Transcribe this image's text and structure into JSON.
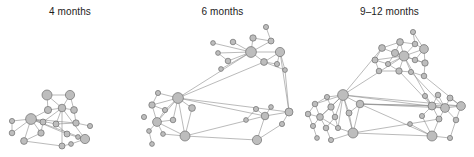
{
  "figure": {
    "background_color": "#ffffff",
    "node_fill_color": "#bdbdbd",
    "node_stroke_color": "#6e6e6e",
    "edge_color": "#8c8c8c",
    "title_color": "#1c1c1c"
  },
  "panels": [
    {
      "id": "panel-4-months",
      "title": "4 months",
      "left": 0,
      "width": 140,
      "node_count": 19,
      "edge_count": 33,
      "nodes": [
        {
          "id": 0,
          "x": 47,
          "y": 95,
          "r": 5.0
        },
        {
          "id": 1,
          "x": 70,
          "y": 95,
          "r": 4.6
        },
        {
          "id": 2,
          "x": 48,
          "y": 110,
          "r": 3.6
        },
        {
          "id": 3,
          "x": 62,
          "y": 108,
          "r": 3.8
        },
        {
          "id": 4,
          "x": 74,
          "y": 110,
          "r": 3.4
        },
        {
          "id": 5,
          "x": 31,
          "y": 119,
          "r": 5.4
        },
        {
          "id": 6,
          "x": 12,
          "y": 121,
          "r": 2.6
        },
        {
          "id": 7,
          "x": 12,
          "y": 133,
          "r": 2.8
        },
        {
          "id": 8,
          "x": 43,
          "y": 122,
          "r": 3.0
        },
        {
          "id": 9,
          "x": 56,
          "y": 124,
          "r": 3.0
        },
        {
          "id": 10,
          "x": 76,
          "y": 123,
          "r": 3.2
        },
        {
          "id": 11,
          "x": 90,
          "y": 126,
          "r": 2.6
        },
        {
          "id": 12,
          "x": 41,
          "y": 133,
          "r": 3.2
        },
        {
          "id": 13,
          "x": 24,
          "y": 141,
          "r": 3.4
        },
        {
          "id": 14,
          "x": 67,
          "y": 134,
          "r": 3.0
        },
        {
          "id": 15,
          "x": 78,
          "y": 137,
          "r": 2.4
        },
        {
          "id": 16,
          "x": 85,
          "y": 139,
          "r": 4.6
        },
        {
          "id": 17,
          "x": 62,
          "y": 146,
          "r": 3.0
        },
        {
          "id": 18,
          "x": 71,
          "y": 144,
          "r": 2.4
        }
      ],
      "edges": [
        [
          0,
          1
        ],
        [
          0,
          3
        ],
        [
          0,
          2
        ],
        [
          1,
          3
        ],
        [
          1,
          4
        ],
        [
          2,
          3
        ],
        [
          2,
          5
        ],
        [
          3,
          4
        ],
        [
          3,
          8
        ],
        [
          3,
          9
        ],
        [
          3,
          16
        ],
        [
          3,
          17
        ],
        [
          4,
          10
        ],
        [
          5,
          6
        ],
        [
          5,
          7
        ],
        [
          5,
          8
        ],
        [
          5,
          12
        ],
        [
          5,
          13
        ],
        [
          5,
          9
        ],
        [
          5,
          10
        ],
        [
          5,
          14
        ],
        [
          5,
          16
        ],
        [
          6,
          7
        ],
        [
          8,
          12
        ],
        [
          9,
          10
        ],
        [
          9,
          14
        ],
        [
          10,
          11
        ],
        [
          12,
          13
        ],
        [
          13,
          17
        ],
        [
          14,
          16
        ],
        [
          15,
          16
        ],
        [
          16,
          18
        ],
        [
          17,
          18
        ]
      ]
    },
    {
      "id": "panel-6-months",
      "title": "6 months",
      "left": 140,
      "width": 165,
      "node_count": 32,
      "edge_count": 45,
      "nodes": [
        {
          "id": 0,
          "x": 126,
          "y": 27,
          "r": 2.6
        },
        {
          "id": 1,
          "x": 113,
          "y": 38,
          "r": 3.2
        },
        {
          "id": 2,
          "x": 131,
          "y": 41,
          "r": 3.0
        },
        {
          "id": 3,
          "x": 73,
          "y": 43,
          "r": 2.4
        },
        {
          "id": 4,
          "x": 93,
          "y": 42,
          "r": 2.8
        },
        {
          "id": 5,
          "x": 111,
          "y": 52,
          "r": 5.4
        },
        {
          "id": 6,
          "x": 140,
          "y": 52,
          "r": 4.6
        },
        {
          "id": 7,
          "x": 78,
          "y": 53,
          "r": 2.4
        },
        {
          "id": 8,
          "x": 88,
          "y": 61,
          "r": 2.8
        },
        {
          "id": 9,
          "x": 124,
          "y": 62,
          "r": 3.4
        },
        {
          "id": 10,
          "x": 137,
          "y": 64,
          "r": 2.6
        },
        {
          "id": 11,
          "x": 81,
          "y": 69,
          "r": 2.4
        },
        {
          "id": 12,
          "x": 145,
          "y": 70,
          "r": 2.4
        },
        {
          "id": 13,
          "x": 38,
          "y": 98,
          "r": 5.4
        },
        {
          "id": 14,
          "x": 18,
          "y": 93,
          "r": 2.6
        },
        {
          "id": 15,
          "x": 12,
          "y": 105,
          "r": 3.2
        },
        {
          "id": 16,
          "x": 25,
          "y": 110,
          "r": 2.6
        },
        {
          "id": 17,
          "x": 52,
          "y": 108,
          "r": 3.4
        },
        {
          "id": 18,
          "x": 4,
          "y": 117,
          "r": 2.6
        },
        {
          "id": 19,
          "x": 17,
          "y": 122,
          "r": 4.4
        },
        {
          "id": 20,
          "x": 33,
          "y": 120,
          "r": 2.8
        },
        {
          "id": 21,
          "x": 9,
          "y": 131,
          "r": 2.4
        },
        {
          "id": 22,
          "x": 23,
          "y": 134,
          "r": 2.4
        },
        {
          "id": 23,
          "x": 45,
          "y": 136,
          "r": 5.0
        },
        {
          "id": 24,
          "x": 12,
          "y": 144,
          "r": 2.4
        },
        {
          "id": 25,
          "x": 106,
          "y": 120,
          "r": 2.4
        },
        {
          "id": 26,
          "x": 116,
          "y": 109,
          "r": 2.6
        },
        {
          "id": 27,
          "x": 131,
          "y": 107,
          "r": 2.4
        },
        {
          "id": 28,
          "x": 125,
          "y": 116,
          "r": 3.8
        },
        {
          "id": 29,
          "x": 149,
          "y": 112,
          "r": 4.0
        },
        {
          "id": 30,
          "x": 142,
          "y": 124,
          "r": 2.6
        },
        {
          "id": 31,
          "x": 117,
          "y": 140,
          "r": 4.6
        }
      ],
      "edges": [
        [
          0,
          2
        ],
        [
          1,
          2
        ],
        [
          1,
          5
        ],
        [
          2,
          5
        ],
        [
          3,
          5
        ],
        [
          4,
          5
        ],
        [
          5,
          6
        ],
        [
          5,
          7
        ],
        [
          5,
          8
        ],
        [
          5,
          9
        ],
        [
          5,
          11
        ],
        [
          6,
          9
        ],
        [
          6,
          10
        ],
        [
          6,
          12
        ],
        [
          7,
          8
        ],
        [
          9,
          10
        ],
        [
          9,
          12
        ],
        [
          5,
          13
        ],
        [
          9,
          13
        ],
        [
          13,
          14
        ],
        [
          13,
          15
        ],
        [
          13,
          16
        ],
        [
          13,
          17
        ],
        [
          13,
          19
        ],
        [
          13,
          20
        ],
        [
          13,
          23
        ],
        [
          13,
          29
        ],
        [
          13,
          28
        ],
        [
          14,
          15
        ],
        [
          15,
          16
        ],
        [
          15,
          19
        ],
        [
          16,
          19
        ],
        [
          17,
          23
        ],
        [
          19,
          20
        ],
        [
          19,
          21
        ],
        [
          19,
          22
        ],
        [
          19,
          23
        ],
        [
          21,
          24
        ],
        [
          22,
          23
        ],
        [
          23,
          31
        ],
        [
          25,
          26
        ],
        [
          26,
          28
        ],
        [
          27,
          28
        ],
        [
          28,
          29
        ],
        [
          28,
          31
        ],
        [
          29,
          30
        ],
        [
          6,
          29
        ],
        [
          12,
          29
        ],
        [
          30,
          31
        ],
        [
          23,
          28
        ]
      ]
    },
    {
      "id": "panel-9-12-months",
      "title": "9–12 months",
      "left": 305,
      "width": 169,
      "node_count": 42,
      "edge_count": 78,
      "nodes": [
        {
          "id": 0,
          "x": 108,
          "y": 32,
          "r": 2.6
        },
        {
          "id": 1,
          "x": 95,
          "y": 42,
          "r": 3.4
        },
        {
          "id": 2,
          "x": 110,
          "y": 44,
          "r": 2.8
        },
        {
          "id": 3,
          "x": 77,
          "y": 48,
          "r": 3.4
        },
        {
          "id": 4,
          "x": 90,
          "y": 53,
          "r": 3.6
        },
        {
          "id": 5,
          "x": 119,
          "y": 49,
          "r": 4.4
        },
        {
          "id": 6,
          "x": 99,
          "y": 56,
          "r": 5.0
        },
        {
          "id": 7,
          "x": 70,
          "y": 60,
          "r": 3.0
        },
        {
          "id": 8,
          "x": 110,
          "y": 60,
          "r": 2.8
        },
        {
          "id": 9,
          "x": 83,
          "y": 64,
          "r": 2.6
        },
        {
          "id": 10,
          "x": 120,
          "y": 63,
          "r": 3.2
        },
        {
          "id": 11,
          "x": 74,
          "y": 71,
          "r": 2.8
        },
        {
          "id": 12,
          "x": 94,
          "y": 71,
          "r": 3.2
        },
        {
          "id": 13,
          "x": 106,
          "y": 72,
          "r": 2.6
        },
        {
          "id": 14,
          "x": 119,
          "y": 76,
          "r": 2.8
        },
        {
          "id": 15,
          "x": 38,
          "y": 95,
          "r": 5.4
        },
        {
          "id": 16,
          "x": 22,
          "y": 97,
          "r": 2.6
        },
        {
          "id": 17,
          "x": 10,
          "y": 104,
          "r": 2.8
        },
        {
          "id": 18,
          "x": 26,
          "y": 107,
          "r": 3.2
        },
        {
          "id": 19,
          "x": 55,
          "y": 104,
          "r": 3.8
        },
        {
          "id": 20,
          "x": 3,
          "y": 114,
          "r": 2.8
        },
        {
          "id": 21,
          "x": 15,
          "y": 117,
          "r": 3.4
        },
        {
          "id": 22,
          "x": 30,
          "y": 117,
          "r": 2.8
        },
        {
          "id": 23,
          "x": 44,
          "y": 113,
          "r": 3.0
        },
        {
          "id": 24,
          "x": 8,
          "y": 126,
          "r": 2.6
        },
        {
          "id": 25,
          "x": 21,
          "y": 128,
          "r": 2.8
        },
        {
          "id": 26,
          "x": 33,
          "y": 128,
          "r": 2.6
        },
        {
          "id": 27,
          "x": 48,
          "y": 133,
          "r": 5.0
        },
        {
          "id": 28,
          "x": 12,
          "y": 138,
          "r": 2.4
        },
        {
          "id": 29,
          "x": 26,
          "y": 140,
          "r": 2.6
        },
        {
          "id": 30,
          "x": 105,
          "y": 124,
          "r": 2.4
        },
        {
          "id": 31,
          "x": 120,
          "y": 96,
          "r": 2.6
        },
        {
          "id": 32,
          "x": 133,
          "y": 95,
          "r": 2.8
        },
        {
          "id": 33,
          "x": 145,
          "y": 98,
          "r": 3.0
        },
        {
          "id": 34,
          "x": 127,
          "y": 106,
          "r": 4.0
        },
        {
          "id": 35,
          "x": 140,
          "y": 108,
          "r": 4.4
        },
        {
          "id": 36,
          "x": 156,
          "y": 106,
          "r": 4.4
        },
        {
          "id": 37,
          "x": 117,
          "y": 116,
          "r": 2.6
        },
        {
          "id": 38,
          "x": 134,
          "y": 119,
          "r": 3.0
        },
        {
          "id": 39,
          "x": 151,
          "y": 120,
          "r": 2.8
        },
        {
          "id": 40,
          "x": 127,
          "y": 136,
          "r": 5.0
        },
        {
          "id": 41,
          "x": 145,
          "y": 138,
          "r": 2.6
        }
      ],
      "edges": [
        [
          0,
          2
        ],
        [
          0,
          5
        ],
        [
          1,
          2
        ],
        [
          1,
          4
        ],
        [
          1,
          3
        ],
        [
          1,
          6
        ],
        [
          2,
          5
        ],
        [
          2,
          6
        ],
        [
          3,
          4
        ],
        [
          3,
          7
        ],
        [
          4,
          6
        ],
        [
          4,
          9
        ],
        [
          5,
          6
        ],
        [
          5,
          10
        ],
        [
          5,
          8
        ],
        [
          6,
          8
        ],
        [
          6,
          9
        ],
        [
          6,
          10
        ],
        [
          6,
          12
        ],
        [
          6,
          13
        ],
        [
          6,
          7
        ],
        [
          7,
          9
        ],
        [
          7,
          11
        ],
        [
          8,
          10
        ],
        [
          9,
          12
        ],
        [
          10,
          14
        ],
        [
          11,
          12
        ],
        [
          12,
          13
        ],
        [
          13,
          14
        ],
        [
          6,
          15
        ],
        [
          3,
          15
        ],
        [
          15,
          16
        ],
        [
          15,
          17
        ],
        [
          15,
          18
        ],
        [
          15,
          19
        ],
        [
          15,
          21
        ],
        [
          15,
          22
        ],
        [
          15,
          23
        ],
        [
          15,
          27
        ],
        [
          15,
          26
        ],
        [
          16,
          17
        ],
        [
          16,
          18
        ],
        [
          17,
          20
        ],
        [
          17,
          21
        ],
        [
          18,
          21
        ],
        [
          18,
          22
        ],
        [
          19,
          23
        ],
        [
          19,
          27
        ],
        [
          20,
          21
        ],
        [
          20,
          24
        ],
        [
          21,
          24
        ],
        [
          21,
          25
        ],
        [
          21,
          26
        ],
        [
          22,
          25
        ],
        [
          22,
          26
        ],
        [
          23,
          27
        ],
        [
          24,
          28
        ],
        [
          25,
          29
        ],
        [
          26,
          27
        ],
        [
          27,
          29
        ],
        [
          27,
          40
        ],
        [
          19,
          34
        ],
        [
          19,
          35
        ],
        [
          19,
          36
        ],
        [
          19,
          40
        ],
        [
          15,
          35
        ],
        [
          15,
          36
        ],
        [
          30,
          40
        ],
        [
          31,
          34
        ],
        [
          32,
          34
        ],
        [
          32,
          35
        ],
        [
          33,
          35
        ],
        [
          33,
          36
        ],
        [
          34,
          35
        ],
        [
          34,
          37
        ],
        [
          34,
          38
        ],
        [
          35,
          36
        ],
        [
          35,
          38
        ],
        [
          35,
          39
        ],
        [
          36,
          39
        ],
        [
          37,
          40
        ],
        [
          38,
          40
        ],
        [
          39,
          41
        ],
        [
          40,
          41
        ],
        [
          12,
          34
        ],
        [
          13,
          35
        ],
        [
          14,
          36
        ],
        [
          6,
          34
        ],
        [
          27,
          38
        ]
      ]
    }
  ]
}
